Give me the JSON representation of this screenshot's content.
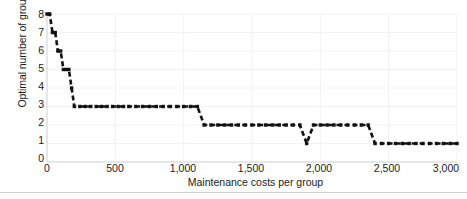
{
  "chart_data": {
    "type": "line",
    "title": "",
    "subtitle": "",
    "xlabel": "Maintenance costs per group",
    "ylabel": "Optimal number of groups",
    "xlim": [
      0,
      3000
    ],
    "ylim": [
      0,
      8
    ],
    "xticks": [
      0,
      500,
      1000,
      1500,
      2000,
      2500,
      3000
    ],
    "xtick_labels": [
      "0",
      "500",
      "1,000",
      "1,500",
      "2,000",
      "2,500",
      "3,000"
    ],
    "yticks": [
      0,
      1,
      2,
      3,
      4,
      5,
      6,
      7,
      8
    ],
    "ytick_labels": [
      "0",
      "1",
      "2",
      "3",
      "4",
      "5",
      "6",
      "7",
      "8"
    ],
    "grid": true,
    "grid_color": "#f2f2f2",
    "axis_color": "#d4d4d4",
    "legend": null,
    "legend_position": "none",
    "series": [
      {
        "name": "Optimal number of groups",
        "color": "#111111",
        "line_style": "dashed",
        "marker": "square",
        "x": [
          0,
          20,
          40,
          60,
          80,
          100,
          120,
          140,
          160,
          180,
          200,
          240,
          280,
          320,
          360,
          400,
          440,
          480,
          520,
          560,
          600,
          650,
          700,
          750,
          800,
          850,
          900,
          950,
          1000,
          1050,
          1100,
          1150,
          1200,
          1250,
          1300,
          1350,
          1400,
          1450,
          1500,
          1550,
          1600,
          1650,
          1700,
          1750,
          1800,
          1850,
          1900,
          1950,
          2000,
          2050,
          2100,
          2150,
          2200,
          2250,
          2300,
          2350,
          2400,
          2450,
          2500,
          2550,
          2600,
          2650,
          2700,
          2750,
          2800,
          2850,
          2900,
          2950,
          3000
        ],
        "y": [
          8,
          8,
          7,
          7,
          6,
          6,
          5,
          5,
          5,
          4,
          3,
          3,
          3,
          3,
          3,
          3,
          3,
          3,
          3,
          3,
          3,
          3,
          3,
          3,
          3,
          3,
          3,
          3,
          3,
          3,
          3,
          2,
          2,
          2,
          2,
          2,
          2,
          2,
          2,
          2,
          2,
          2,
          2,
          2,
          2,
          2,
          1,
          2,
          2,
          2,
          2,
          2,
          2,
          2,
          2,
          2,
          1,
          1,
          1,
          1,
          1,
          1,
          1,
          1,
          1,
          1,
          1,
          1,
          1
        ]
      }
    ]
  }
}
